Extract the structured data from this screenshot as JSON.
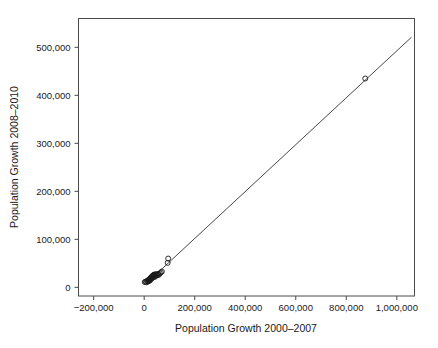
{
  "chart_data": {
    "type": "scatter",
    "title": "",
    "xlabel": "Population Growth 2000–2007",
    "ylabel": "Population Growth 2008–2010",
    "xlim": [
      -260000,
      1070000
    ],
    "ylim": [
      -18000,
      560000
    ],
    "grid": false,
    "legend": null,
    "xticks": [
      -200000,
      0,
      200000,
      400000,
      600000,
      800000,
      1000000
    ],
    "xticklabels": [
      "−200,000",
      "0",
      "200,000",
      "400,000",
      "600,000",
      "800,000",
      "1,000,000"
    ],
    "yticks": [
      0,
      100000,
      200000,
      300000,
      400000,
      500000
    ],
    "yticklabels": [
      "0",
      "100,000",
      "200,000",
      "300,000",
      "400,000",
      "500,000"
    ],
    "marker": "open-circle",
    "series": [
      {
        "name": "cities",
        "points": [
          [
            2000,
            11000
          ],
          [
            6000,
            12000
          ],
          [
            9000,
            10500
          ],
          [
            12000,
            13500
          ],
          [
            14000,
            12000
          ],
          [
            16000,
            15000
          ],
          [
            18000,
            13000
          ],
          [
            20000,
            16500
          ],
          [
            21000,
            14000
          ],
          [
            23000,
            18000
          ],
          [
            24000,
            15500
          ],
          [
            25000,
            19000
          ],
          [
            26000,
            17000
          ],
          [
            27000,
            20500
          ],
          [
            28000,
            18500
          ],
          [
            29000,
            21500
          ],
          [
            30000,
            19500
          ],
          [
            31000,
            22500
          ],
          [
            32000,
            20000
          ],
          [
            33000,
            23500
          ],
          [
            34000,
            21000
          ],
          [
            35000,
            24500
          ],
          [
            36000,
            22000
          ],
          [
            37000,
            25500
          ],
          [
            38000,
            23000
          ],
          [
            39000,
            26000
          ],
          [
            40000,
            24000
          ],
          [
            41000,
            27000
          ],
          [
            42000,
            25000
          ],
          [
            43000,
            22000
          ],
          [
            45000,
            26500
          ],
          [
            47000,
            24500
          ],
          [
            49000,
            27500
          ],
          [
            52000,
            25500
          ],
          [
            55000,
            28000
          ],
          [
            58000,
            26000
          ],
          [
            62000,
            29000
          ],
          [
            66000,
            31000
          ],
          [
            70000,
            33000
          ],
          [
            93000,
            51000
          ],
          [
            95000,
            60000
          ],
          [
            875000,
            435000
          ]
        ]
      }
    ],
    "fit_line": {
      "name": "regression-line",
      "x_start": 10000,
      "y_start": 9000,
      "x_end": 1058000,
      "y_end": 521000
    }
  },
  "axes": {
    "x_title": "Population Growth 2000–2007",
    "y_title": "Population Growth 2008–2010"
  }
}
